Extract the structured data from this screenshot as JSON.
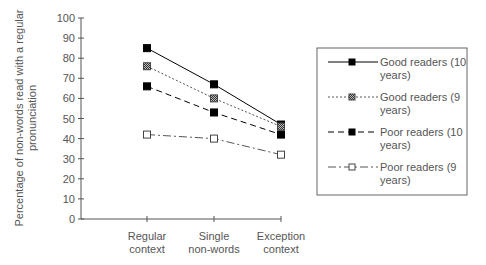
{
  "chart_data": {
    "type": "line",
    "title": "",
    "xlabel": "",
    "ylabel": "Percentage of non-words read with a regular pronunciation",
    "ylabel_lines": [
      "Percentage of non-words read with a regular",
      "pronunciation"
    ],
    "ylim": [
      0,
      100
    ],
    "yticks": [
      0,
      10,
      20,
      30,
      40,
      50,
      60,
      70,
      80,
      90,
      100
    ],
    "categories": [
      "Regular context",
      "Single non-words",
      "Exception context"
    ],
    "category_lines": [
      [
        "Regular",
        "context"
      ],
      [
        "Single",
        "non-words"
      ],
      [
        "Exception",
        "context"
      ]
    ],
    "grid": false,
    "legend_position": "right",
    "series": [
      {
        "name": "Good readers (10 years)",
        "legend_lines": [
          "Good readers (10",
          "years)"
        ],
        "values": [
          85,
          67,
          47
        ],
        "marker": "filled-square",
        "line": "solid",
        "color": "#000000"
      },
      {
        "name": "Good readers (9 years)",
        "legend_lines": [
          "Good readers (9",
          "years)"
        ],
        "values": [
          76,
          60,
          46
        ],
        "marker": "hatched-square",
        "line": "dotted",
        "color": "#555555"
      },
      {
        "name": "Poor readers (10 years)",
        "legend_lines": [
          "Poor readers (10",
          "years)"
        ],
        "values": [
          66,
          53,
          42
        ],
        "marker": "filled-square",
        "line": "dashed",
        "color": "#000000"
      },
      {
        "name": "Poor readers (9 years)",
        "legend_lines": [
          "Poor readers (9",
          "years)"
        ],
        "values": [
          42,
          40,
          32
        ],
        "marker": "open-square",
        "line": "dash-dot",
        "color": "#555555"
      }
    ]
  }
}
